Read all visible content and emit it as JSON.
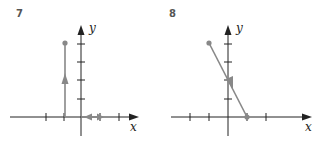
{
  "colors": {
    "axis": "#222222",
    "path": "#888888",
    "point": "#888888",
    "background": "#ffffff"
  },
  "problems": [
    {
      "number": "7",
      "axes": {
        "x_label": "x",
        "y_label": "y"
      },
      "description": "Vertical path from (-1,0) up to (-1,4) with upward arrow; small horizontal arrows on x-axis between 0 and 1",
      "start_point": [
        -1,
        4
      ],
      "segments": [
        {
          "from": [
            -1,
            0
          ],
          "to": [
            -1,
            4
          ]
        },
        {
          "from": [
            0,
            0
          ],
          "to": [
            1,
            0
          ]
        }
      ]
    },
    {
      "number": "8",
      "axes": {
        "x_label": "x",
        "y_label": "y"
      },
      "description": "Straight line segment from (-1,4) to (1,0) with arrow at (0,2)",
      "start_point": [
        -1,
        4
      ],
      "end_point": [
        1,
        0
      ],
      "segments": [
        {
          "from": [
            -1,
            4
          ],
          "to": [
            1,
            0
          ]
        }
      ]
    }
  ]
}
